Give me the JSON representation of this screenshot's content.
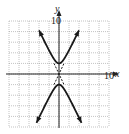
{
  "chart_data": {
    "type": "line",
    "title": "",
    "equation": "y^2/4 - x^2 = 1",
    "xlabel": "x",
    "ylabel": "y",
    "xlim": [
      -10,
      10
    ],
    "ylim": [
      -10,
      10
    ],
    "grid": true,
    "grid_step": 2,
    "tick_labels": {
      "x": [
        "10"
      ],
      "y": [
        "10"
      ]
    },
    "series": [
      {
        "name": "upper branch",
        "style": "solid",
        "vertex": [
          0,
          2
        ],
        "points": [
          [
            -4,
            8.25
          ],
          [
            -3,
            6.32
          ],
          [
            -2,
            4.47
          ],
          [
            -1,
            2.83
          ],
          [
            0,
            2
          ],
          [
            1,
            2.83
          ],
          [
            2,
            4.47
          ],
          [
            3,
            6.32
          ],
          [
            4,
            8.25
          ]
        ]
      },
      {
        "name": "lower branch",
        "style": "solid",
        "vertex": [
          0,
          -2
        ],
        "points": [
          [
            -4.5,
            -9.22
          ],
          [
            -3,
            -6.32
          ],
          [
            -2,
            -4.47
          ],
          [
            -1,
            -2.83
          ],
          [
            0,
            -2
          ],
          [
            1,
            -2.83
          ],
          [
            2,
            -4.47
          ],
          [
            3,
            -6.32
          ],
          [
            4.5,
            -9.22
          ]
        ]
      },
      {
        "name": "asymptote y = 2x",
        "style": "dashed",
        "points": [
          [
            -1,
            -2
          ],
          [
            1,
            2
          ]
        ]
      },
      {
        "name": "asymptote y = -2x",
        "style": "dashed",
        "points": [
          [
            -1,
            2
          ],
          [
            1,
            -2
          ]
        ]
      }
    ]
  },
  "axes": {
    "x_label": "x",
    "y_label": "y",
    "x_tick": "10",
    "y_tick": "10"
  }
}
